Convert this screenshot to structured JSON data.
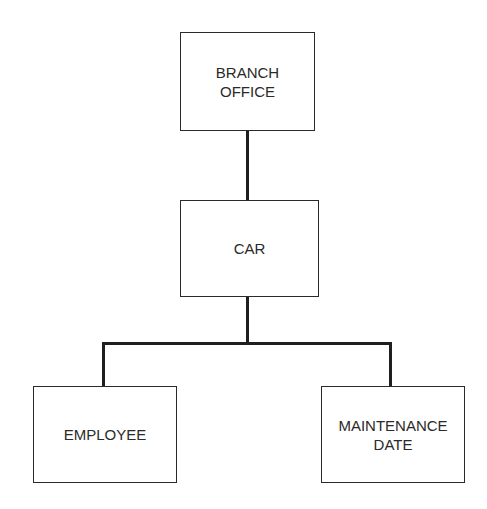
{
  "diagram": {
    "type": "hierarchy",
    "nodes": [
      {
        "id": "branch_office",
        "label": "BRANCH\nOFFICE",
        "level": 0
      },
      {
        "id": "car",
        "label": "CAR",
        "level": 1
      },
      {
        "id": "employee",
        "label": "EMPLOYEE",
        "level": 2
      },
      {
        "id": "maintenance_date",
        "label": "MAINTENANCE\nDATE",
        "level": 2
      }
    ],
    "edges": [
      {
        "from": "branch_office",
        "to": "car"
      },
      {
        "from": "car",
        "to": "employee"
      },
      {
        "from": "car",
        "to": "maintenance_date"
      }
    ],
    "colors": {
      "line": "#1f1f1f",
      "text": "#2a2a2a",
      "background": "#ffffff"
    }
  }
}
